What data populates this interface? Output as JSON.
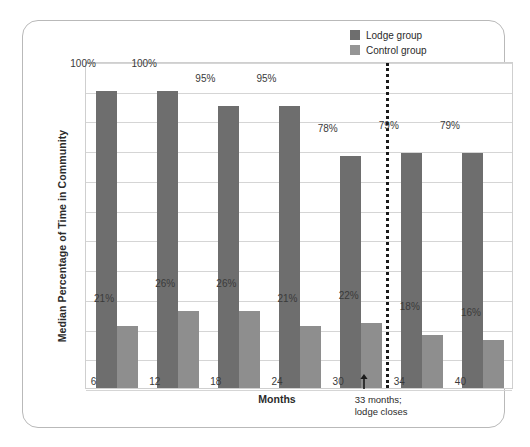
{
  "figure": {
    "y_axis_title": "Median Percentage of Time in Community",
    "x_axis_title": "Months"
  },
  "legend": {
    "items": [
      {
        "label": "Lodge group",
        "color": "#6e6e6e",
        "swatch_name": "legend-swatch-lodge"
      },
      {
        "label": "Control group",
        "color": "#959595",
        "swatch_name": "legend-swatch-control"
      }
    ]
  },
  "annotation": {
    "line1": "33 months;",
    "line2": "lodge closes",
    "arrow_icon": "up-arrow-icon"
  },
  "chart_data": {
    "type": "bar",
    "title": "",
    "xlabel": "Months",
    "ylabel": "Median Percentage of Time in Community",
    "categories": [
      "6",
      "12",
      "18",
      "24",
      "30",
      "34",
      "40"
    ],
    "ylim": [
      0,
      110
    ],
    "grid": true,
    "gridline_interval": 10,
    "legend_position": "top-right",
    "value_suffix": "%",
    "series": [
      {
        "name": "Lodge group",
        "color": "#6e6e6e",
        "values": [
          100,
          100,
          95,
          95,
          78,
          79,
          79
        ],
        "labels": [
          "100%",
          "100%",
          "95%",
          "95%",
          "78%",
          "79%",
          "79%"
        ]
      },
      {
        "name": "Control group",
        "color": "#8e8e8e",
        "values": [
          21,
          26,
          26,
          21,
          22,
          18,
          16
        ],
        "labels": [
          "21%",
          "26%",
          "26%",
          "21%",
          "22%",
          "18%",
          "16%"
        ]
      }
    ],
    "annotations": [
      {
        "type": "vertical-dotted-line",
        "at_month": 33,
        "text": "33 months; lodge closes"
      }
    ]
  }
}
